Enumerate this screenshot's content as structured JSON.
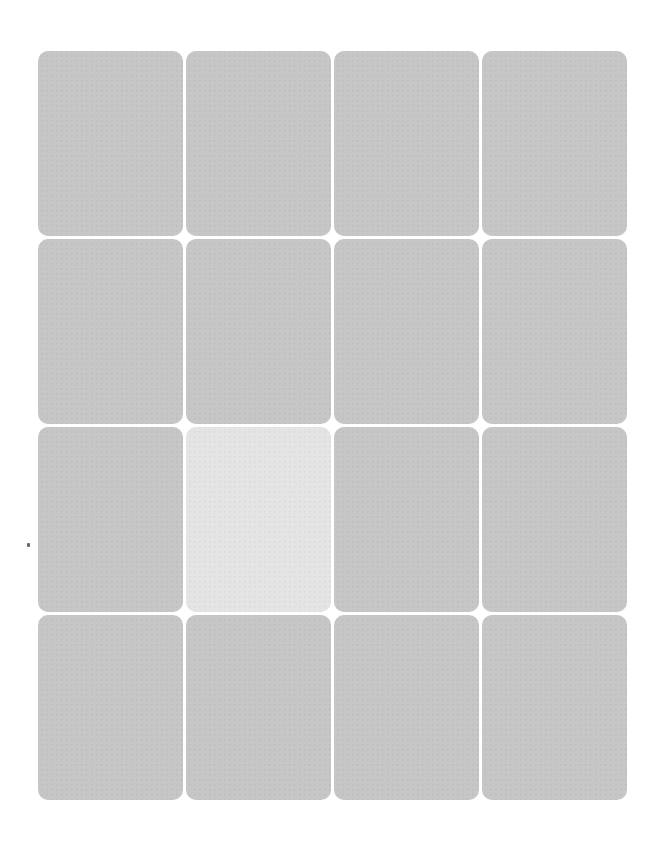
{
  "board": {
    "rows": 4,
    "columns": 4,
    "card_color": "#c6c6c6",
    "selected_card_color": "#e4e4e4",
    "cards": [
      {
        "row": 1,
        "col": 1,
        "state": "face-down"
      },
      {
        "row": 1,
        "col": 2,
        "state": "face-down"
      },
      {
        "row": 1,
        "col": 3,
        "state": "face-down"
      },
      {
        "row": 1,
        "col": 4,
        "state": "face-down"
      },
      {
        "row": 2,
        "col": 1,
        "state": "face-down"
      },
      {
        "row": 2,
        "col": 2,
        "state": "face-down"
      },
      {
        "row": 2,
        "col": 3,
        "state": "face-down"
      },
      {
        "row": 2,
        "col": 4,
        "state": "face-down"
      },
      {
        "row": 3,
        "col": 1,
        "state": "face-down"
      },
      {
        "row": 3,
        "col": 2,
        "state": "selected"
      },
      {
        "row": 3,
        "col": 3,
        "state": "face-down"
      },
      {
        "row": 3,
        "col": 4,
        "state": "face-down"
      },
      {
        "row": 4,
        "col": 1,
        "state": "face-down"
      },
      {
        "row": 4,
        "col": 2,
        "state": "face-down"
      },
      {
        "row": 4,
        "col": 3,
        "state": "face-down"
      },
      {
        "row": 4,
        "col": 4,
        "state": "face-down"
      }
    ]
  }
}
